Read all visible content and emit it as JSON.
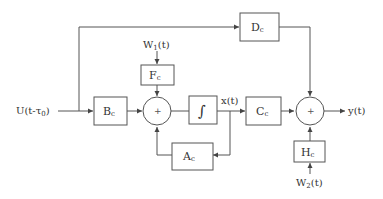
{
  "diagram": {
    "type": "block-diagram",
    "signals": {
      "input": "U(t-τ",
      "input_sub": "0",
      "input_close": ")",
      "w1_main": "W",
      "w1_sub": "1",
      "w1_tail": "(t)",
      "w2_main": "W",
      "w2_sub": "2",
      "w2_tail": "(t)",
      "state": "x(t)",
      "output": "y(t)"
    },
    "blocks": {
      "Bc": {
        "main": "B",
        "sub": "c"
      },
      "Fc": {
        "main": "F",
        "sub": "c"
      },
      "Integrator": {
        "main": "∫"
      },
      "Ac": {
        "main": "A",
        "sub": "c"
      },
      "Cc": {
        "main": "C",
        "sub": "c"
      },
      "Dc": {
        "main": "D",
        "sub": "c"
      },
      "Hc": {
        "main": "H",
        "sub": "c"
      }
    },
    "summers": {
      "sum1": "+",
      "sum2": "+"
    }
  }
}
